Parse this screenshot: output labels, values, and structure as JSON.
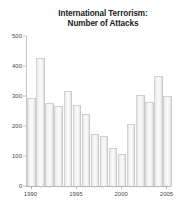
{
  "chart_data": {
    "type": "bar",
    "title": "International Terrorism: Number of Attacks",
    "title_lines": [
      "International Terrorism:",
      "Number of Attacks"
    ],
    "xlabel": "",
    "ylabel": "",
    "categories": [
      1990,
      1991,
      1992,
      1993,
      1994,
      1995,
      1996,
      1997,
      1998,
      1999,
      2000,
      2001,
      2002,
      2003,
      2004,
      2005
    ],
    "values": [
      290,
      423,
      275,
      265,
      315,
      268,
      237,
      170,
      163,
      125,
      103,
      205,
      299,
      277,
      365,
      298
    ],
    "ylim": [
      0,
      500
    ],
    "xlim": [
      1989.5,
      2005.5
    ],
    "ytick_labels": [
      "0",
      "100",
      "200",
      "300",
      "400",
      "500"
    ],
    "ytick_values": [
      0,
      100,
      200,
      300,
      400,
      500
    ],
    "xtick_labels": [
      "1990",
      "1995",
      "2000",
      "2005"
    ],
    "xtick_values": [
      1990,
      1995,
      2000,
      2005
    ],
    "grid": false,
    "legend": null,
    "bar_color": "#f2f2f2",
    "bar_edge_color": "#cfcfcf",
    "axis_color": "#b4b4b4",
    "text_color": "#4a4a4a",
    "title_color": "#1b1b1b",
    "background": "#ffffff"
  }
}
